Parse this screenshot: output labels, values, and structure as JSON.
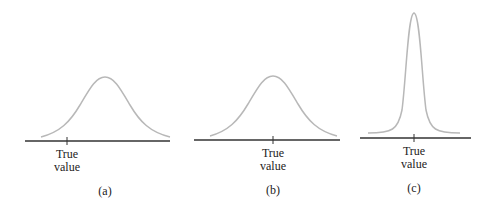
{
  "figure": {
    "panels": [
      {
        "id": "a",
        "caption": "(a)",
        "tick_label_line1": "True",
        "tick_label_line2": "value",
        "description": "wide distribution, offset from true value (biased, imprecise)"
      },
      {
        "id": "b",
        "caption": "(b)",
        "tick_label_line1": "True",
        "tick_label_line2": "value",
        "description": "wide distribution centered on true value (unbiased, imprecise)"
      },
      {
        "id": "c",
        "caption": "(c)",
        "tick_label_line1": "True",
        "tick_label_line2": "value",
        "description": "narrow distribution centered on true value (unbiased, precise)"
      }
    ],
    "colors": {
      "curve": "#b8b8b8",
      "axis": "#333333",
      "text": "#222222"
    }
  }
}
